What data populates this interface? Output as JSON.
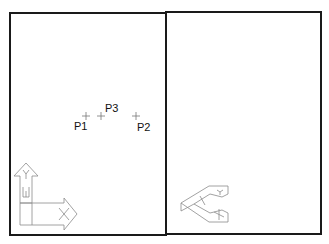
{
  "viewports": [
    {
      "name": "left-viewport",
      "view": "plan"
    },
    {
      "name": "right-viewport",
      "view": "isometric"
    }
  ],
  "points": [
    {
      "label": "P1",
      "x": 86,
      "y": 116
    },
    {
      "label": "P3",
      "x": 101,
      "y": 116
    },
    {
      "label": "P2",
      "x": 136,
      "y": 116
    }
  ],
  "ucs_icon_left": {
    "x_axis": "X",
    "y_axis": "Y",
    "w_marker": "W"
  },
  "ucs_icon_right": {
    "x_axis": "X",
    "y_axis": "Y"
  },
  "colors": {
    "frame": "#1a1a1a",
    "icon": "#8a8a8a",
    "background": "#ffffff"
  }
}
